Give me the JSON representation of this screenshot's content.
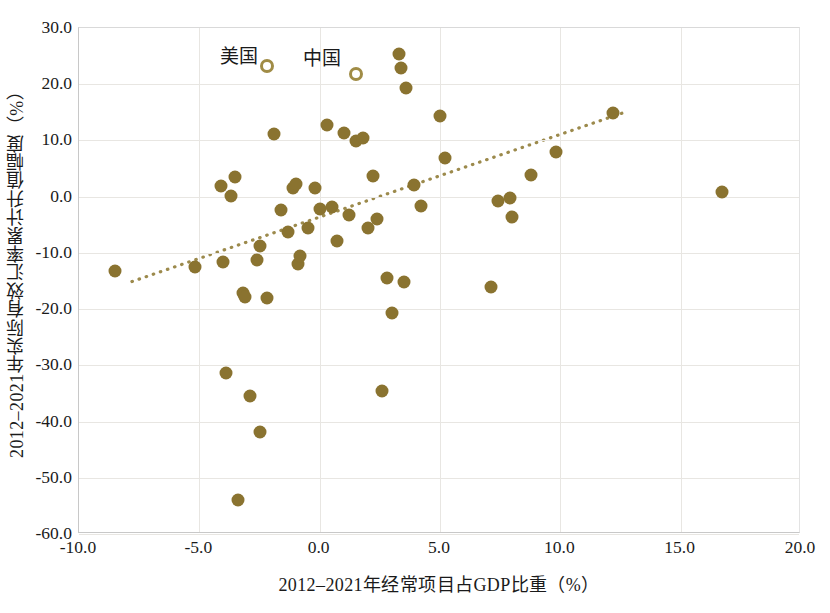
{
  "chart_data": {
    "type": "scatter",
    "title": "",
    "xlabel": "2012–2021年经常项目占GDP比重（%）",
    "ylabel": "2012–2021年实际有效汇率累计升值幅度（%）",
    "xlim": [
      -10.0,
      20.0
    ],
    "ylim": [
      -60.0,
      30.0
    ],
    "grid": true,
    "legend_position": "none",
    "x_ticks": [
      "-10.0",
      "-5.0",
      "0.0",
      "5.0",
      "10.0",
      "15.0",
      "20.0"
    ],
    "x_tick_values": [
      -10.0,
      -5.0,
      0.0,
      5.0,
      10.0,
      15.0,
      20.0
    ],
    "y_ticks": [
      "30.0",
      "20.0",
      "10.0",
      "0.0",
      "-10.0",
      "-20.0",
      "-30.0",
      "-40.0",
      "-50.0",
      "-60.0"
    ],
    "y_tick_values": [
      30.0,
      20.0,
      10.0,
      0.0,
      -10.0,
      -20.0,
      -30.0,
      -40.0,
      -50.0,
      -60.0
    ],
    "marker_color": "#8a7330",
    "highlight_marker_color": "#a08c46",
    "trendline": {
      "style": "dotted",
      "color": "#9c8a4c",
      "x_start": -7.8,
      "y_start": -15.1,
      "x_end": 12.6,
      "y_end": 14.9
    },
    "points": [
      {
        "x": -8.5,
        "y": -13.3
      },
      {
        "x": -5.2,
        "y": -12.5
      },
      {
        "x": -4.1,
        "y": 1.9
      },
      {
        "x": -4.0,
        "y": -11.7
      },
      {
        "x": -3.9,
        "y": -31.4
      },
      {
        "x": -3.7,
        "y": 0.2
      },
      {
        "x": -3.5,
        "y": 3.5
      },
      {
        "x": -3.4,
        "y": -54.0
      },
      {
        "x": -3.2,
        "y": -17.2
      },
      {
        "x": -3.1,
        "y": -17.9
      },
      {
        "x": -2.9,
        "y": -35.4
      },
      {
        "x": -2.6,
        "y": -11.2
      },
      {
        "x": -2.5,
        "y": -8.7
      },
      {
        "x": -2.5,
        "y": -41.8
      },
      {
        "x": -2.2,
        "y": -18.1
      },
      {
        "x": -1.9,
        "y": 11.1
      },
      {
        "x": -1.6,
        "y": -2.4
      },
      {
        "x": -1.3,
        "y": -6.2
      },
      {
        "x": -1.1,
        "y": 1.6
      },
      {
        "x": -1.0,
        "y": 2.3
      },
      {
        "x": -0.9,
        "y": -11.9
      },
      {
        "x": -0.8,
        "y": -10.6
      },
      {
        "x": -0.5,
        "y": -5.5
      },
      {
        "x": -0.2,
        "y": 1.5
      },
      {
        "x": 0.0,
        "y": -2.2
      },
      {
        "x": 0.3,
        "y": 12.7
      },
      {
        "x": 0.5,
        "y": -1.9
      },
      {
        "x": 0.7,
        "y": -7.9
      },
      {
        "x": 1.0,
        "y": 11.4
      },
      {
        "x": 1.2,
        "y": -3.2
      },
      {
        "x": 1.5,
        "y": 9.9
      },
      {
        "x": 1.8,
        "y": 10.5
      },
      {
        "x": 2.0,
        "y": -5.6
      },
      {
        "x": 2.2,
        "y": 3.6
      },
      {
        "x": 2.4,
        "y": -4.0
      },
      {
        "x": 2.6,
        "y": -34.5
      },
      {
        "x": 2.8,
        "y": -14.4
      },
      {
        "x": 3.0,
        "y": -20.7
      },
      {
        "x": 3.3,
        "y": 25.3
      },
      {
        "x": 3.4,
        "y": 22.8
      },
      {
        "x": 3.5,
        "y": -15.1
      },
      {
        "x": 3.6,
        "y": 19.3
      },
      {
        "x": 3.9,
        "y": 2.1
      },
      {
        "x": 4.2,
        "y": -1.7
      },
      {
        "x": 5.0,
        "y": 14.4
      },
      {
        "x": 5.2,
        "y": 6.8
      },
      {
        "x": 7.1,
        "y": -16.0
      },
      {
        "x": 7.4,
        "y": -0.8
      },
      {
        "x": 7.9,
        "y": -0.3
      },
      {
        "x": 8.0,
        "y": -3.6
      },
      {
        "x": 8.8,
        "y": 3.8
      },
      {
        "x": 9.8,
        "y": 7.9
      },
      {
        "x": 12.2,
        "y": 14.9
      },
      {
        "x": 16.7,
        "y": 0.8
      }
    ],
    "annotations": [
      {
        "label": "美国",
        "label_x": -3.35,
        "label_y": 25.3,
        "marker_x": -2.2,
        "marker_y": 23.2,
        "marker": "hollow-circle"
      },
      {
        "label": "中国",
        "label_x": 0.1,
        "label_y": 25.0,
        "marker_x": 1.5,
        "marker_y": 21.8,
        "marker": "hollow-circle"
      }
    ]
  }
}
